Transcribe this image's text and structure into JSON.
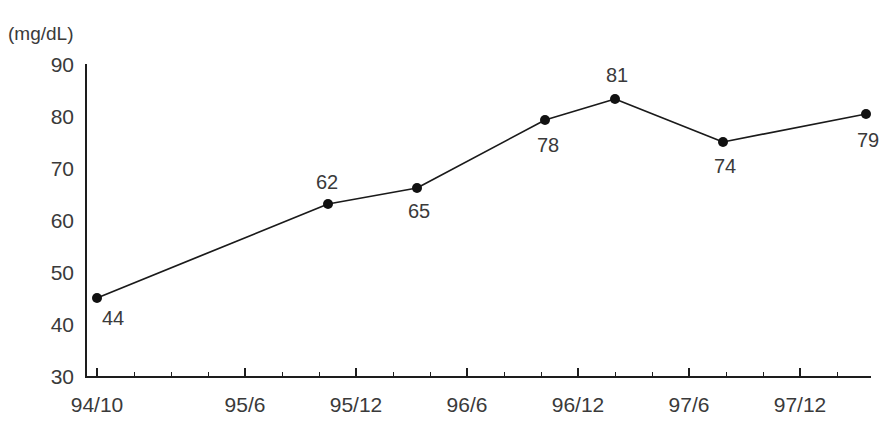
{
  "chart_data": {
    "type": "line",
    "title": "",
    "subtitle": "",
    "xlabel": "",
    "ylabel": "",
    "unit_label": "(mg/dL)",
    "categories": [
      "94/10",
      "95/6",
      "95/12",
      "96/6",
      "96/12",
      "97/6",
      "97/12"
    ],
    "x": [
      0,
      6.3,
      10.8,
      14.2,
      18.0,
      21.0,
      26.0
    ],
    "values": [
      44,
      62,
      65,
      78,
      81,
      74,
      79
    ],
    "point_labels": [
      "44",
      "62",
      "65",
      "78",
      "81",
      "74",
      "79"
    ],
    "point_label_positions": [
      "below",
      "above",
      "below",
      "below",
      "above",
      "below",
      "below"
    ],
    "ylim": [
      30,
      90
    ],
    "yticks": [
      30,
      40,
      50,
      60,
      70,
      80,
      90
    ],
    "ytick_labels": [
      "30",
      "40",
      "50",
      "60",
      "70",
      "80",
      "90"
    ],
    "grid": false,
    "legend": "none",
    "line_color": "#1a1a1a",
    "marker_color": "#111111",
    "axis_color": "#1d1d1d",
    "text_color": "#3a3a3a",
    "background_color": "#ffffff",
    "marker_radius": 5,
    "points_px": [
      {
        "x": 97,
        "y": 298,
        "label": "44",
        "lx": 113,
        "ly": 325
      },
      {
        "x": 328,
        "y": 204,
        "label": "62",
        "lx": 327,
        "ly": 189
      },
      {
        "x": 417,
        "y": 188,
        "label": "65",
        "lx": 419,
        "ly": 218
      },
      {
        "x": 545,
        "y": 120,
        "label": "78",
        "lx": 548,
        "ly": 152
      },
      {
        "x": 615,
        "y": 99,
        "label": "81",
        "lx": 617,
        "ly": 82
      },
      {
        "x": 723,
        "y": 142,
        "label": "74",
        "lx": 725,
        "ly": 173
      },
      {
        "x": 866,
        "y": 114,
        "label": "79",
        "lx": 868,
        "ly": 147
      }
    ],
    "ytick_px": [
      {
        "value": "90",
        "y": 64
      },
      {
        "value": "80",
        "y": 116
      },
      {
        "value": "70",
        "y": 168
      },
      {
        "value": "60",
        "y": 220
      },
      {
        "value": "50",
        "y": 272
      },
      {
        "value": "40",
        "y": 324
      },
      {
        "value": "30",
        "y": 376
      }
    ],
    "xtick_px": [
      {
        "label": "94/10",
        "x": 97,
        "major": true
      },
      {
        "label": "",
        "x": 134,
        "major": false
      },
      {
        "label": "",
        "x": 171,
        "major": false
      },
      {
        "label": "",
        "x": 208,
        "major": false
      },
      {
        "label": "95/6",
        "x": 245,
        "major": true
      },
      {
        "label": "",
        "x": 282,
        "major": false
      },
      {
        "label": "",
        "x": 319,
        "major": false
      },
      {
        "label": "95/12",
        "x": 356,
        "major": true
      },
      {
        "label": "",
        "x": 393,
        "major": false
      },
      {
        "label": "",
        "x": 430,
        "major": false
      },
      {
        "label": "96/6",
        "x": 467,
        "major": true
      },
      {
        "label": "",
        "x": 504,
        "major": false
      },
      {
        "label": "",
        "x": 541,
        "major": false
      },
      {
        "label": "96/12",
        "x": 578,
        "major": true
      },
      {
        "label": "",
        "x": 615,
        "major": false
      },
      {
        "label": "",
        "x": 652,
        "major": false
      },
      {
        "label": "97/6",
        "x": 689,
        "major": true
      },
      {
        "label": "",
        "x": 726,
        "major": false
      },
      {
        "label": "",
        "x": 763,
        "major": false
      },
      {
        "label": "97/12",
        "x": 800,
        "major": true
      },
      {
        "label": "",
        "x": 837,
        "major": false
      }
    ],
    "axis_geometry": {
      "x_origin": 86,
      "x_end": 871,
      "y_top": 64,
      "y_bottom": 377
    }
  }
}
